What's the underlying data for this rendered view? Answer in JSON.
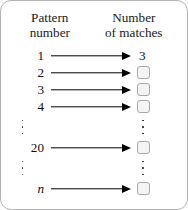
{
  "diagram": {
    "border_color": "#b4b4b4",
    "background_color": "#ffffff",
    "arrow_color": "#000000",
    "box_fill_color": "#f4f4f4",
    "box_border_color": "#a8a8a8"
  },
  "headers": {
    "left": {
      "line1": "Pattern",
      "line2": "number"
    },
    "right": {
      "line1": "Number",
      "line2": "of matches"
    }
  },
  "rows": [
    {
      "kind": "mapping",
      "label": "1",
      "italic": false,
      "answer": "3",
      "filled": true
    },
    {
      "kind": "mapping",
      "label": "2",
      "italic": false,
      "answer": "",
      "filled": false
    },
    {
      "kind": "mapping",
      "label": "3",
      "italic": false,
      "answer": "",
      "filled": false
    },
    {
      "kind": "mapping",
      "label": "4",
      "italic": false,
      "answer": "",
      "filled": false
    },
    {
      "kind": "ellipsis",
      "dots": 3
    },
    {
      "kind": "mapping",
      "label": "20",
      "italic": false,
      "answer": "",
      "filled": false
    },
    {
      "kind": "ellipsis",
      "dots": 3
    },
    {
      "kind": "mapping",
      "label": "n",
      "italic": true,
      "answer": "",
      "filled": false
    }
  ]
}
